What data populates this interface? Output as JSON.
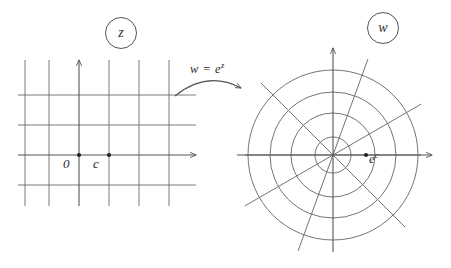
{
  "figure": {
    "type": "complex-plane-mapping-diagram",
    "width": 451,
    "height": 268,
    "background": "#ffffff",
    "ink_color": "#555555",
    "text_color": "#2b2b2b"
  },
  "z_plane": {
    "tag_label": "z",
    "tag_center": [
      120,
      32
    ],
    "description": "Cartesian grid of horizontal and vertical lines in the z-plane",
    "origin": [
      79,
      155
    ],
    "grid_spacing": 30,
    "vertical_lines_x": [
      25,
      49,
      79,
      109,
      139,
      169
    ],
    "horizontal_lines_y": [
      95,
      125,
      155,
      185
    ],
    "grid_extent": {
      "x_min": 18,
      "x_max": 196,
      "y_min": 60,
      "y_max": 206
    },
    "real_axis": {
      "y": 155,
      "x_start": 18,
      "x_end": 196,
      "arrow": "right"
    },
    "imaginary_axis": {
      "x": 79,
      "y_start": 206,
      "y_end": 60,
      "arrow": "up"
    },
    "points": [
      {
        "name": "origin",
        "label": "0",
        "x": 79,
        "y": 155
      },
      {
        "name": "c",
        "label": "c",
        "x": 109,
        "y": 155
      }
    ]
  },
  "mapping": {
    "label": "w = e",
    "exponent": "z",
    "full_label": "w = e^z",
    "arrow": {
      "from": [
        175,
        95
      ],
      "ctrl": [
        205,
        72
      ],
      "to": [
        243,
        88
      ],
      "head": "right"
    }
  },
  "w_plane": {
    "tag_label": "w",
    "tag_center": [
      382,
      27
    ],
    "description": "Polar grid of concentric circles and radial rays in the w-plane",
    "center": [
      333,
      155
    ],
    "circle_radii": [
      18,
      42,
      63,
      85
    ],
    "ray_angles_deg": [
      0,
      30,
      70,
      135,
      180,
      210,
      250,
      315
    ],
    "ray_length": 102,
    "real_axis": {
      "y": 155,
      "x_start": 237,
      "x_end": 432,
      "arrow": "right"
    },
    "imaginary_axis": {
      "x": 333,
      "y_start": 252,
      "y_end": 48,
      "arrow": "up"
    },
    "points": [
      {
        "name": "e-to-the-c",
        "label": "e",
        "exponent": "c",
        "x": 366,
        "y": 155
      }
    ]
  }
}
